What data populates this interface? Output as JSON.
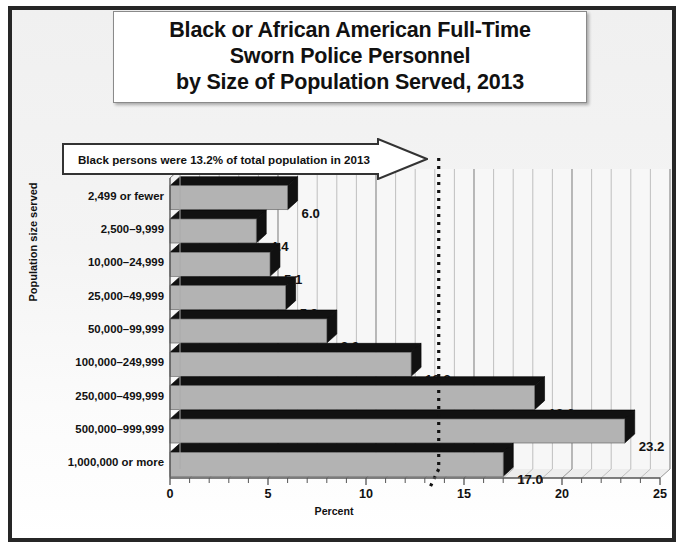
{
  "figure": {
    "title_lines": [
      "Black or African American Full-Time",
      "Sworn Police Personnel",
      "by Size of Population Served, 2013"
    ],
    "callout_text": "Black persons were 13.2% of total population in 2013",
    "reference_value": 13.2,
    "colors": {
      "bar_face": "#b3b3b3",
      "bar_shade": "#111111",
      "frame": "#262626",
      "background": "#f2f2f2",
      "gridline": "#9a9a9a",
      "text": "#111111"
    }
  },
  "chart_data": {
    "type": "bar",
    "orientation": "horizontal",
    "title": "Black or African American Full-Time Sworn Police Personnel by Size of Population Served, 2013",
    "xlabel": "Percent",
    "ylabel": "Population size served",
    "xlim": [
      0,
      25
    ],
    "xticks": [
      0,
      5,
      10,
      15,
      20,
      25
    ],
    "xtick_labels": [
      "0",
      "5",
      "10",
      "15",
      "20",
      "25"
    ],
    "minor_tick_step": 1,
    "grid": true,
    "legend": false,
    "categories": [
      "2,499 or fewer",
      "2,500–9,999",
      "10,000–24,999",
      "25,000–49,999",
      "50,000–99,999",
      "100,000–249,999",
      "250,000–499,999",
      "500,000–999,999",
      "1,000,000 or more"
    ],
    "values": [
      6.0,
      4.4,
      5.1,
      5.9,
      8.0,
      12.3,
      18.6,
      23.2,
      17.0
    ],
    "data_labels": [
      "6.0",
      "4.4",
      "5.1",
      "5.9",
      "8.0",
      "12.3",
      "18.6",
      "23.2",
      "17.0"
    ],
    "annotations": [
      {
        "text": "Black persons were 13.2% of total population in 2013",
        "type": "arrow-callout",
        "points_to_x": 13.2
      },
      {
        "text": "",
        "type": "reference-line",
        "x": 13.2,
        "style": "dotted"
      }
    ]
  }
}
